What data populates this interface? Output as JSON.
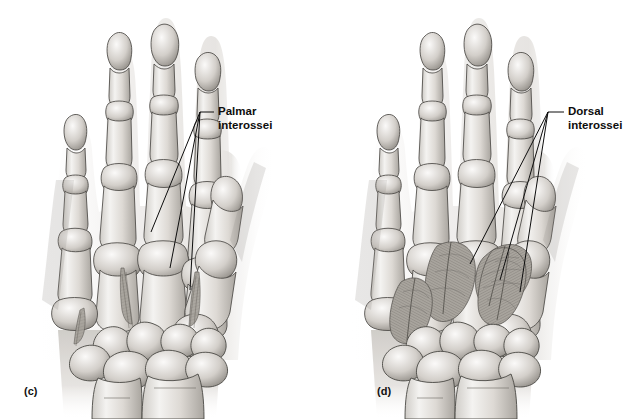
{
  "figure": {
    "background_color": "#ffffff",
    "ink_color": "#1a1a1a",
    "type": "anatomical-illustration",
    "panel_count": 2
  },
  "panels": [
    {
      "id": "c",
      "label": "(c)",
      "view": "palmar",
      "callout": {
        "line1": "Palmar",
        "line2": "interossei",
        "leader_origin_x": 214,
        "leader_origin_y": 112
      }
    },
    {
      "id": "d",
      "label": "(d)",
      "view": "dorsal",
      "callout": {
        "line1": "Dorsal",
        "line2": "interossei",
        "leader_origin_x": 564,
        "leader_origin_y": 112
      }
    }
  ],
  "anatomy": {
    "bone_fill_light": "#f2f1ef",
    "bone_fill_mid": "#c9c6c1",
    "bone_fill_dark": "#8e8a84",
    "muscle_fill": "#9a968f",
    "outline": "#4a4844",
    "soft_tissue": "#eceae7"
  }
}
